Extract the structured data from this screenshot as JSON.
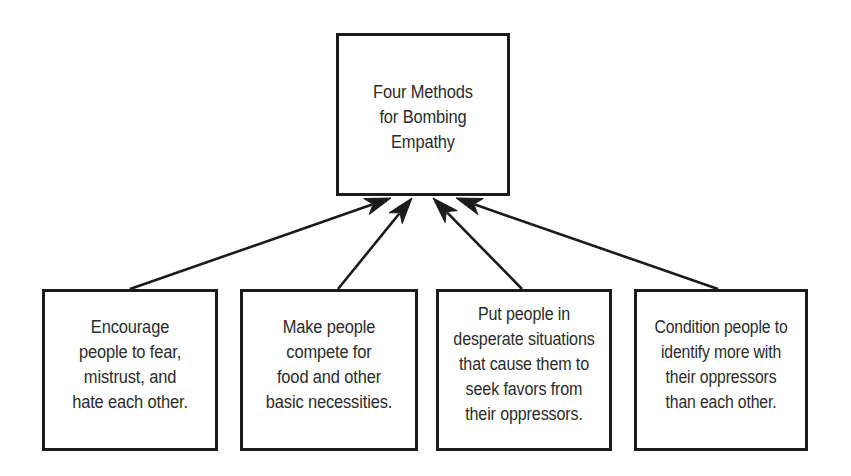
{
  "diagram": {
    "type": "converging-arrow-diagram",
    "background_color": "#ffffff",
    "line_color": "#1b1b1b",
    "text_color": "#2b2b2b",
    "root": {
      "id": "root",
      "text": "Four Methods\nfor Bombing\nEmpathy"
    },
    "leaves": [
      {
        "id": "leaf-0",
        "text": "Encourage\npeople to fear,\nmistrust, and\nhate each other."
      },
      {
        "id": "leaf-1",
        "text": "Make people\ncompete for\nfood and other\nbasic necessities."
      },
      {
        "id": "leaf-2",
        "text": "Put people in\ndesperate situations\nthat cause them to\nseek favors from\ntheir oppressors."
      },
      {
        "id": "leaf-3",
        "text": "Condition people to\nidentify more with\ntheir oppressors\nthan each other."
      }
    ],
    "arrows": [
      {
        "id": "arrow-0",
        "from": "leaf-0",
        "to": "root",
        "x1": 130,
        "y1": 289,
        "x2": 391,
        "y2": 198
      },
      {
        "id": "arrow-1",
        "from": "leaf-1",
        "to": "root",
        "x1": 338,
        "y1": 289,
        "x2": 412,
        "y2": 198
      },
      {
        "id": "arrow-2",
        "from": "leaf-2",
        "to": "root",
        "x1": 522,
        "y1": 289,
        "x2": 433,
        "y2": 198
      },
      {
        "id": "arrow-3",
        "from": "leaf-3",
        "to": "root",
        "x1": 718,
        "y1": 289,
        "x2": 456,
        "y2": 198
      }
    ]
  }
}
